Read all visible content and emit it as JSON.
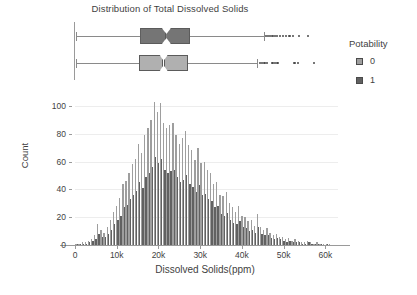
{
  "chart_data": {
    "type": "bar",
    "title": "Distribution of Total Dissolved Solids",
    "xlabel": "Dissolved Solids(ppm)",
    "ylabel": "Count",
    "xlim": [
      0,
      63000
    ],
    "ylim": [
      0,
      105
    ],
    "xticks": [
      0,
      10000,
      20000,
      30000,
      40000,
      50000,
      60000
    ],
    "xticklabels": [
      "0",
      "10k",
      "20k",
      "30k",
      "40k",
      "50k",
      "60k"
    ],
    "yticks": [
      0,
      20,
      40,
      60,
      80,
      100
    ],
    "yticklabels": [
      "0",
      "20",
      "40",
      "60",
      "80",
      "100"
    ],
    "grid": true,
    "grid_axis": "y",
    "legend": {
      "title": "Potability",
      "position": "right",
      "entries": [
        {
          "label": "0",
          "color": "#9e9e9e"
        },
        {
          "label": "1",
          "color": "#616161"
        }
      ]
    },
    "bin_width": 750,
    "bin_centers": [
      375,
      1125,
      1875,
      2625,
      3375,
      4125,
      4875,
      5625,
      6375,
      7125,
      7875,
      8625,
      9375,
      10125,
      10875,
      11625,
      12375,
      13125,
      13875,
      14625,
      15375,
      16125,
      16875,
      17625,
      18375,
      19125,
      19875,
      20625,
      21375,
      22125,
      22875,
      23625,
      24375,
      25125,
      25875,
      26625,
      27375,
      28125,
      28875,
      29625,
      30375,
      31125,
      31875,
      32625,
      33375,
      34125,
      34875,
      35625,
      36375,
      37125,
      37875,
      38625,
      39375,
      40125,
      40875,
      41625,
      42375,
      43125,
      43875,
      44625,
      45375,
      46125,
      46875,
      47625,
      48375,
      49125,
      49875,
      50625,
      51375,
      52125,
      52875,
      53625,
      54375,
      55125,
      55875,
      56625,
      57375,
      58125,
      58875,
      59625,
      60375,
      61125
    ],
    "series": [
      {
        "name": "0",
        "label": "Potability 0",
        "color": "#9e9e9e",
        "values": [
          1,
          1,
          2,
          2,
          3,
          4,
          7,
          15,
          11,
          9,
          13,
          18,
          24,
          28,
          34,
          44,
          46,
          52,
          58,
          62,
          73,
          66,
          79,
          84,
          90,
          103,
          96,
          102,
          88,
          84,
          86,
          88,
          79,
          73,
          77,
          82,
          72,
          68,
          61,
          70,
          59,
          60,
          54,
          52,
          44,
          45,
          36,
          35,
          38,
          30,
          27,
          24,
          28,
          21,
          20,
          17,
          18,
          14,
          22,
          13,
          11,
          12,
          9,
          7,
          8,
          6,
          6,
          4,
          5,
          3,
          4,
          3,
          2,
          2,
          3,
          2,
          1,
          2,
          1,
          1,
          1,
          1
        ]
      },
      {
        "name": "1",
        "label": "Potability 1",
        "color": "#616161",
        "values": [
          1,
          1,
          1,
          1,
          2,
          3,
          4,
          8,
          6,
          6,
          8,
          11,
          15,
          18,
          21,
          27,
          29,
          33,
          36,
          39,
          45,
          41,
          49,
          52,
          56,
          63,
          59,
          62,
          54,
          52,
          53,
          54,
          49,
          45,
          47,
          50,
          44,
          42,
          38,
          43,
          36,
          37,
          33,
          32,
          27,
          28,
          22,
          21,
          23,
          18,
          16,
          15,
          17,
          13,
          12,
          10,
          11,
          9,
          13,
          8,
          7,
          7,
          5,
          4,
          5,
          4,
          3,
          2,
          3,
          2,
          2,
          2,
          1,
          1,
          2,
          1,
          1,
          1,
          1,
          0,
          1,
          0
        ]
      }
    ],
    "boxplots": [
      {
        "name": "1",
        "label": "Potability 1",
        "color": "#757575",
        "row": 0,
        "whisker_low": 320,
        "q1": 15600,
        "median": 21900,
        "q3": 27600,
        "whisker_high": 45200,
        "notch_low": 20800,
        "notch_high": 23000,
        "outliers": [
          45800,
          46200,
          46700,
          47100,
          47500,
          48000,
          48400,
          49100,
          49900,
          50600,
          51400,
          52300,
          53600,
          55900
        ]
      },
      {
        "name": "0",
        "label": "Potability 0",
        "color": "#b0b0b0",
        "row": 1,
        "whisker_low": 180,
        "q1": 15300,
        "median": 21200,
        "q3": 27100,
        "whisker_high": 43700,
        "notch_low": 20300,
        "notch_high": 22200,
        "outliers": [
          44300,
          44800,
          45400,
          46000,
          47300,
          47900,
          48500,
          52600,
          53500,
          57200
        ]
      }
    ]
  }
}
